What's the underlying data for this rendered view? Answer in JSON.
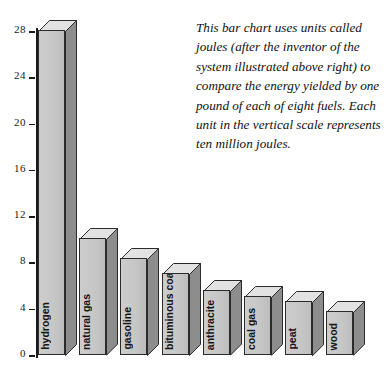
{
  "caption": {
    "text": "This bar chart uses units called joules (after the inventor of the system illustrated above right) to compare the energy yielded by one pound of each of eight fuels. Each unit in the vertical scale represents ten million joules."
  },
  "axis": {
    "ticks": [
      "28",
      "24",
      "20",
      "16",
      "12",
      "8",
      "4",
      "0"
    ]
  },
  "chart_data": {
    "type": "bar",
    "title": "",
    "subtitle": "",
    "xlabel": "",
    "ylabel": "",
    "ylim": [
      0,
      29
    ],
    "grid": false,
    "legend": "none",
    "unit_note": "Each unit in the vertical scale represents ten million joules.",
    "tick_labels": [
      "0",
      "4",
      "8",
      "12",
      "16",
      "20",
      "24",
      "28"
    ],
    "categories": [
      "hydrogen",
      "natural gas",
      "gasoline",
      "bituminous coal",
      "anthracite",
      "coal gas",
      "peat",
      "wood"
    ],
    "values": [
      28,
      10,
      8.3,
      7,
      5.5,
      5,
      4.6,
      3.7
    ],
    "annotation": "This bar chart uses units called joules (after the inventor of the system illustrated above right) to compare the energy yielded by one pound of each of eight fuels. Each unit in the vertical scale represents ten million joules."
  },
  "bars": [
    {
      "label": "hydrogen",
      "value": 28,
      "two_line": false
    },
    {
      "label": "natural gas",
      "value": 10,
      "two_line": false
    },
    {
      "label": "gasoline",
      "value": 8.3,
      "two_line": false
    },
    {
      "label": "bituminous coal",
      "value": 7,
      "two_line": true
    },
    {
      "label": "anthracite",
      "value": 5.5,
      "two_line": false
    },
    {
      "label": "coal gas",
      "value": 5,
      "two_line": false
    },
    {
      "label": "peat",
      "value": 4.6,
      "two_line": false
    },
    {
      "label": "wood",
      "value": 3.7,
      "two_line": false
    }
  ],
  "colors": {
    "bar_face": "#c6c6c6",
    "bar_side": "#8d8d8d",
    "bar_top": "#e2e2e2",
    "outline": "#2b2b2b",
    "text": "#111111",
    "background": "#ffffff"
  }
}
